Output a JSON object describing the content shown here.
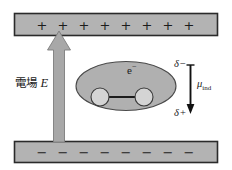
{
  "figure": {
    "background_color": "#ffffff"
  },
  "colors": {
    "plate_fill": "#b3b3b3",
    "plate_border": "#2b2b2b",
    "arrow_fill": "#a8a8a8",
    "arrow_border": "#6e6e6e",
    "molecule_fill": "#b0b0b0",
    "molecule_border": "#4a4a4a",
    "atom_fill": "#d4d4d4",
    "atom_border": "#3a3a3a",
    "bond_color": "#1c1c1c",
    "dipole_arrow_color": "#111111",
    "text_color": "#1a1a1a"
  },
  "top_plate": {
    "name": "positively charged plate",
    "charge_sign": "+",
    "charge_count": 8,
    "signs": [
      "+",
      "+",
      "+",
      "+",
      "+",
      "+",
      "+",
      "+"
    ]
  },
  "bottom_plate": {
    "name": "negatively charged plate",
    "charge_sign": "−",
    "charge_count": 8,
    "signs": [
      "−",
      "−",
      "−",
      "−",
      "−",
      "−",
      "−",
      "−"
    ]
  },
  "field_arrow": {
    "label_text": "電場",
    "label_symbol": "E",
    "direction": "up",
    "meaning": "electric field E pointing from negative plate to positive plate"
  },
  "molecule": {
    "electron_cloud_label": "e",
    "electron_cloud_superscript": "−",
    "atom_count": 2,
    "shape": "ellipse"
  },
  "dipole": {
    "top_charge": "δ",
    "top_charge_sign": "−",
    "bottom_charge": "δ",
    "bottom_charge_sign": "+",
    "moment_symbol": "μ",
    "moment_subscript": "ind",
    "arrow_direction": "down"
  }
}
